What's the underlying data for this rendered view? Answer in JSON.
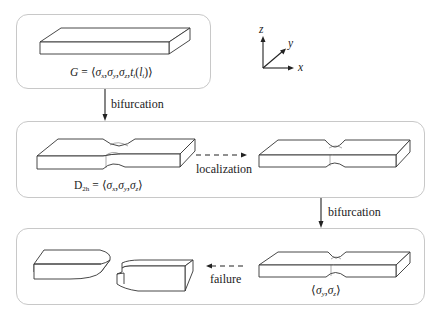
{
  "panels": [
    {
      "id": "initial-state",
      "formula": {
        "lhs": "G",
        "eq": " = ⟨",
        "terms": [
          "σ",
          "σ",
          "σ",
          "t",
          "(l",
          ")⟩"
        ],
        "subs": [
          "x",
          "y",
          "z",
          "i",
          "i"
        ],
        "text": "G = ⟨σx, σy, σz, ti(li)⟩"
      }
    },
    {
      "id": "necking-state",
      "formula": {
        "lhs": "D",
        "lhs_sub": "2h",
        "text": "D2h = ⟨σx, σy, σz⟩"
      }
    },
    {
      "id": "failure-state",
      "formula": {
        "text": "⟨σy, σz⟩"
      }
    }
  ],
  "transitions": {
    "first": "bifurcation",
    "localization": "localization",
    "second": "bifurcation",
    "failure": "failure"
  },
  "axes": {
    "z": "z",
    "y": "y",
    "x": "x"
  },
  "symbols": {
    "sigma": "σ",
    "comma": ",",
    "open": "⟨",
    "close": "⟩",
    "eq": " = ",
    "G": "G",
    "D": "D",
    "t": "t",
    "l": "l",
    "lparen": "(",
    "rparen": ")",
    "sub_x": "x",
    "sub_y": "y",
    "sub_z": "z",
    "sub_i": "i",
    "sub_2h": "2h"
  }
}
